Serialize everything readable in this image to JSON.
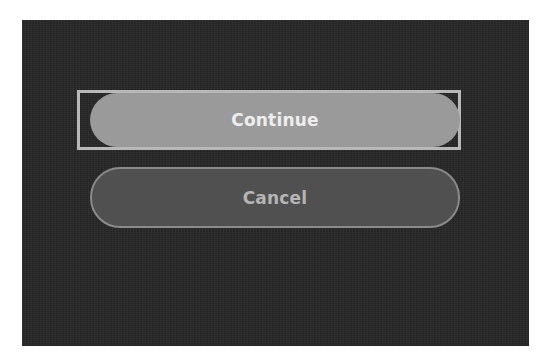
{
  "dialog": {
    "buttons": {
      "continue": {
        "label": "Continue",
        "focused": true
      },
      "cancel": {
        "label": "Cancel",
        "focused": false
      }
    }
  },
  "colors": {
    "panel_background": "#2a2a2a",
    "primary_button": "#9a9a9a",
    "secondary_button": "#505050",
    "focus_ring": "#b8b8b8"
  }
}
